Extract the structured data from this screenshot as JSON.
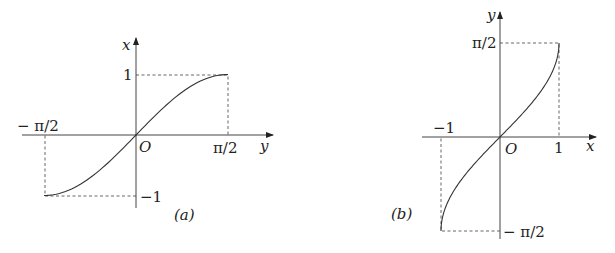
{
  "figures": [
    {
      "id": "a",
      "caption": "(a)",
      "function": "x = sin y",
      "horizontal_axis": {
        "label": "y",
        "tick_neg": "− π/2",
        "tick_pos": "π/2"
      },
      "vertical_axis": {
        "label": "x",
        "tick_pos": "1",
        "tick_neg": "−1"
      },
      "origin_label": "O"
    },
    {
      "id": "b",
      "caption": "(b)",
      "function": "y = arcsin x",
      "horizontal_axis": {
        "label": "x",
        "tick_neg": "−1",
        "tick_pos": "1"
      },
      "vertical_axis": {
        "label": "y",
        "tick_pos": "π/2",
        "tick_neg": "− π/2"
      },
      "origin_label": "O"
    }
  ],
  "chart_data": [
    {
      "type": "line",
      "title": "(a)",
      "xlabel": "y",
      "ylabel": "x",
      "xlim": [
        -1.5708,
        1.5708
      ],
      "ylim": [
        -1,
        1
      ],
      "xticks": [
        "−π/2",
        "π/2"
      ],
      "yticks": [
        "−1",
        "1"
      ],
      "series": [
        {
          "name": "x = sin y",
          "x": [
            -1.5708,
            -0.7854,
            0,
            0.7854,
            1.5708
          ],
          "values": [
            -1,
            -0.7071,
            0,
            0.7071,
            1
          ]
        }
      ],
      "grid": false
    },
    {
      "type": "line",
      "title": "(b)",
      "xlabel": "x",
      "ylabel": "y",
      "xlim": [
        -1,
        1
      ],
      "ylim": [
        -1.5708,
        1.5708
      ],
      "xticks": [
        "−1",
        "1"
      ],
      "yticks": [
        "−π/2",
        "π/2"
      ],
      "series": [
        {
          "name": "y = arcsin x",
          "x": [
            -1,
            -0.5,
            0,
            0.5,
            1
          ],
          "values": [
            -1.5708,
            -0.5236,
            0,
            0.5236,
            1.5708
          ]
        }
      ],
      "grid": false
    }
  ]
}
